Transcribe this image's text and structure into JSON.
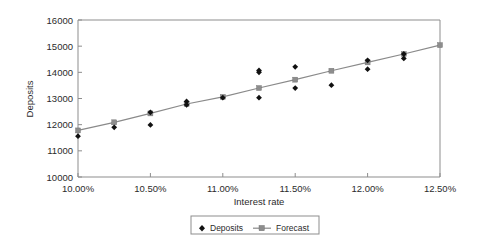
{
  "chart_data": {
    "type": "scatter",
    "title": "",
    "xlabel": "Interest rate",
    "ylabel": "Deposits",
    "xlim": [
      10.0,
      12.5
    ],
    "ylim": [
      10000,
      16000
    ],
    "grid": false,
    "legend_position": "bottom",
    "x_tick_labels": [
      "10.00%",
      "10.50%",
      "11.00%",
      "11.50%",
      "12.00%",
      "12.50%"
    ],
    "x_tick_values": [
      10.0,
      10.5,
      11.0,
      11.5,
      12.0,
      12.5
    ],
    "y_tick_labels": [
      "10000",
      "11000",
      "12000",
      "13000",
      "14000",
      "15000",
      "16000"
    ],
    "y_tick_values": [
      10000,
      11000,
      12000,
      13000,
      14000,
      15000,
      16000
    ],
    "series": [
      {
        "name": "Deposits",
        "marker": "diamond",
        "color": "#111111",
        "points": [
          {
            "x": 10.0,
            "y": 11560
          },
          {
            "x": 10.25,
            "y": 11900
          },
          {
            "x": 10.5,
            "y": 12470
          },
          {
            "x": 10.5,
            "y": 11990
          },
          {
            "x": 10.75,
            "y": 12890
          },
          {
            "x": 10.75,
            "y": 12760
          },
          {
            "x": 11.0,
            "y": 13030
          },
          {
            "x": 11.25,
            "y": 14070
          },
          {
            "x": 11.25,
            "y": 14000
          },
          {
            "x": 11.25,
            "y": 13030
          },
          {
            "x": 11.5,
            "y": 14210
          },
          {
            "x": 11.5,
            "y": 13400
          },
          {
            "x": 11.75,
            "y": 13510
          },
          {
            "x": 12.0,
            "y": 14460
          },
          {
            "x": 12.0,
            "y": 14120
          },
          {
            "x": 12.25,
            "y": 14700
          },
          {
            "x": 12.25,
            "y": 14530
          }
        ]
      },
      {
        "name": "Forecast",
        "marker": "square",
        "color": "#8d8d8d",
        "points": [
          {
            "x": 10.0,
            "y": 11780
          },
          {
            "x": 10.25,
            "y": 12090
          },
          {
            "x": 10.5,
            "y": 12430
          },
          {
            "x": 10.75,
            "y": 12790
          },
          {
            "x": 11.0,
            "y": 13060
          },
          {
            "x": 11.25,
            "y": 13400
          },
          {
            "x": 11.5,
            "y": 13720
          },
          {
            "x": 11.75,
            "y": 14060
          },
          {
            "x": 12.0,
            "y": 14380
          },
          {
            "x": 12.25,
            "y": 14700
          },
          {
            "x": 12.5,
            "y": 15040
          }
        ]
      }
    ],
    "legend": [
      {
        "label": "Deposits",
        "marker": "diamond",
        "color": "#111111"
      },
      {
        "label": "Forecast",
        "marker": "square-line",
        "color": "#8d8d8d"
      }
    ]
  }
}
